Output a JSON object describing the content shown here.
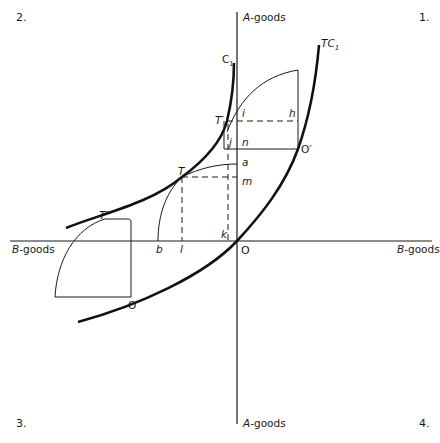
{
  "quadrants": {
    "q1": "1.",
    "q2": "2.",
    "q3": "3.",
    "q4": "4."
  },
  "axes": {
    "vertical_top": "A-goods",
    "vertical_bottom": "A-goods",
    "horizontal_left": "B-goods",
    "horizontal_right": "B-goods",
    "origin": "O"
  },
  "curves": {
    "tc1": "TC",
    "tc1_sub": "1",
    "c1": "C",
    "c1_sub": "1"
  },
  "points": {
    "o_prime": "O′",
    "o_double_prime": "O″",
    "t": "T",
    "t_prime": "T′",
    "t_double_prime": "T″",
    "a": "a",
    "b": "b",
    "h": "h",
    "i": "i",
    "j": "j",
    "k": "k",
    "l": "l",
    "m": "m",
    "n": "n"
  },
  "colors": {
    "ink": "#1a1a1a",
    "background": "#ffffff"
  }
}
